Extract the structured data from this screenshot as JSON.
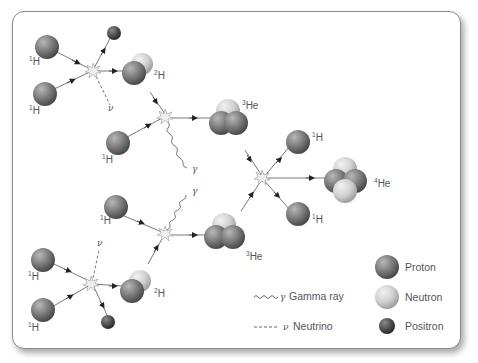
{
  "diagram": {
    "labels": {
      "h1": "H",
      "h1_sup": "1",
      "h2": "H",
      "h2_sup": "2",
      "he3": "He",
      "he3_sup": "3",
      "he4": "He",
      "he4_sup": "4",
      "gamma": "γ",
      "nu": "ν"
    },
    "legend": {
      "gamma_symbol": "γ",
      "gamma_label": "Gamma ray",
      "nu_symbol": "ν",
      "nu_label": "Neutrino",
      "proton": "Proton",
      "neutron": "Neutron",
      "positron": "Positron"
    },
    "colors": {
      "proton": "#7a7a7a",
      "neutron": "#c8c8c8",
      "positron": "#555555",
      "line": "#555555",
      "text": "#555555"
    }
  }
}
